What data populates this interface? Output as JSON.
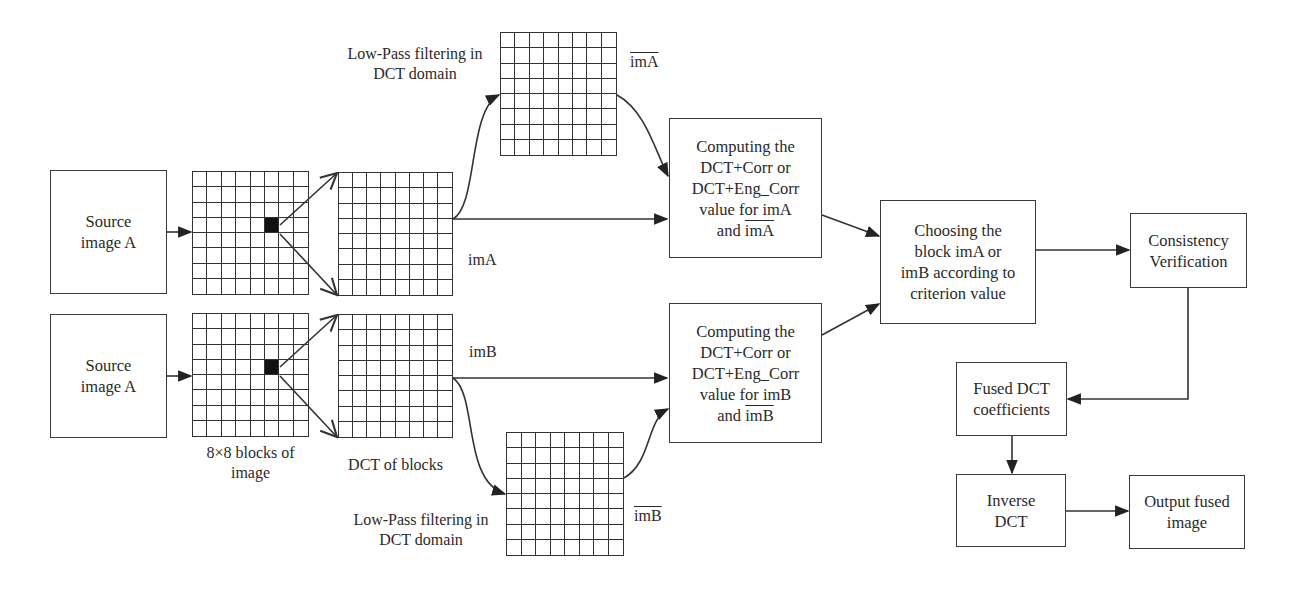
{
  "diagram": {
    "colors": {
      "stroke": "#333333",
      "background": "#ffffff",
      "filled_block": "#111111"
    },
    "source_boxes": [
      {
        "id": "source-a-top",
        "lines": [
          "Source",
          "image A"
        ]
      },
      {
        "id": "source-a-bottom",
        "lines": [
          "Source",
          "image A"
        ]
      }
    ],
    "grids": {
      "blocks_top": {
        "rows": 8,
        "cols": 8,
        "highlight": [
          3,
          5
        ]
      },
      "blocks_bottom": {
        "rows": 8,
        "cols": 8,
        "highlight": [
          3,
          5
        ]
      },
      "dct_top": {
        "rows": 8,
        "cols": 8
      },
      "dct_bottom": {
        "rows": 8,
        "cols": 8
      },
      "lowpass_top": {
        "rows": 8,
        "cols": 8
      },
      "lowpass_bottom": {
        "rows": 8,
        "cols": 8
      }
    },
    "labels": {
      "blocks": [
        "8×8 blocks of",
        "image"
      ],
      "dct_of_blocks": "DCT of blocks",
      "lowpass_top": [
        "Low-Pass filtering in",
        "DCT domain"
      ],
      "lowpass_bottom": [
        "Low-Pass filtering in",
        "DCT domain"
      ],
      "imA": "imA",
      "imB": "imB",
      "imA_bar": "imA",
      "imB_bar": "imB"
    },
    "compute_top": {
      "lines": [
        "Computing the",
        "DCT+Corr or",
        "DCT+Eng_Corr",
        "value for imA"
      ],
      "last_prefix": "and ",
      "last_overlined": "imA"
    },
    "compute_bottom": {
      "lines": [
        "Computing the",
        "DCT+Corr or",
        "DCT+Eng_Corr",
        "value for imB"
      ],
      "last_prefix": "and ",
      "last_overlined": "imB"
    },
    "choose": {
      "lines": [
        "Choosing the",
        "block imA or",
        "imB according to",
        "criterion value"
      ]
    },
    "consistency": {
      "lines": [
        "Consistency",
        "Verification"
      ]
    },
    "fused": {
      "lines": [
        "Fused DCT",
        "coefficients"
      ]
    },
    "inverse": {
      "lines": [
        "Inverse",
        "DCT"
      ]
    },
    "output": {
      "lines": [
        "Output fused",
        "image"
      ]
    }
  }
}
